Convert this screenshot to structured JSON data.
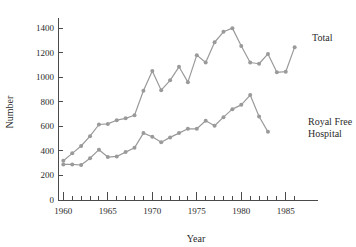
{
  "chart_data": {
    "type": "line",
    "title": "",
    "xlabel": "Year",
    "ylabel": "Number",
    "xlim": [
      1959.4,
      1986.6
    ],
    "ylim": [
      0,
      1450
    ],
    "grid": false,
    "legend_position": "right-inline",
    "y_ticks": [
      0,
      200,
      400,
      600,
      800,
      1000,
      1200,
      1400
    ],
    "y_tick_labels": [
      "0",
      "200",
      "400",
      "600",
      "800",
      "1000",
      "1200",
      "1400"
    ],
    "x_ticks": [
      1960,
      1965,
      1970,
      1975,
      1980,
      1985
    ],
    "x_tick_labels": [
      "1960",
      "1965",
      "1970",
      "1975",
      "1980",
      "1985"
    ],
    "x_minor_ticks": [
      1961,
      1962,
      1963,
      1964,
      1966,
      1967,
      1968,
      1969,
      1971,
      1972,
      1973,
      1974,
      1976,
      1977,
      1978,
      1979,
      1981,
      1982,
      1983,
      1984,
      1986
    ],
    "series": [
      {
        "name": "Total",
        "color": "#9a9a9a",
        "label_text": "Total",
        "x": [
          1960,
          1961,
          1962,
          1963,
          1964,
          1965,
          1966,
          1967,
          1968,
          1969,
          1970,
          1971,
          1972,
          1973,
          1974,
          1975,
          1976,
          1977,
          1978,
          1979,
          1980,
          1981,
          1982,
          1983,
          1984,
          1985,
          1986
        ],
        "values": [
          320,
          380,
          440,
          520,
          615,
          620,
          650,
          665,
          690,
          890,
          1050,
          895,
          975,
          1085,
          960,
          1180,
          1120,
          1285,
          1370,
          1400,
          1255,
          1120,
          1110,
          1190,
          1040,
          1045,
          1245
        ]
      },
      {
        "name": "Royal Free Hospital",
        "color": "#9a9a9a",
        "label_text": "Royal Free\nHospital",
        "label_line_1": "Royal Free",
        "label_line_2": "Hospital",
        "x": [
          1960,
          1961,
          1962,
          1963,
          1964,
          1965,
          1966,
          1967,
          1968,
          1969,
          1970,
          1971,
          1972,
          1973,
          1974,
          1975,
          1976,
          1977,
          1978,
          1979,
          1980,
          1981,
          1982,
          1983
        ],
        "values": [
          290,
          290,
          285,
          340,
          410,
          350,
          355,
          390,
          425,
          545,
          515,
          470,
          510,
          545,
          580,
          580,
          645,
          605,
          675,
          740,
          775,
          855,
          680,
          555
        ]
      }
    ],
    "annotations": [
      {
        "name": "total-series-label",
        "text": "Total"
      },
      {
        "name": "royal-free-series-label-line1",
        "text": "Royal Free"
      },
      {
        "name": "royal-free-series-label-line2",
        "text": "Hospital"
      }
    ]
  }
}
